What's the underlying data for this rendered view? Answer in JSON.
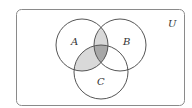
{
  "diagram": {
    "type": "venn",
    "universe_label": "U",
    "sets": [
      {
        "label": "A",
        "cx": 82,
        "cy": 45,
        "r": 26
      },
      {
        "label": "B",
        "cx": 120,
        "cy": 45,
        "r": 26
      },
      {
        "label": "C",
        "cx": 101,
        "cy": 72,
        "r": 27
      }
    ],
    "shaded_regions": [
      {
        "region": "A∩B",
        "color": "#d9d9d9"
      },
      {
        "region": "A∩C",
        "color": "#d9d9d9"
      },
      {
        "region": "A∩B∩C",
        "color": "#a8a8a8"
      }
    ],
    "colors": {
      "outline": "#555555",
      "frame": "#8a8a8a",
      "light_shade": "#d9d9d9",
      "dark_shade": "#a8a8a8"
    }
  }
}
